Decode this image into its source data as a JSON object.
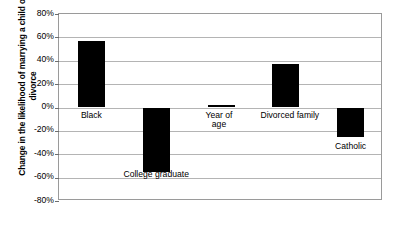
{
  "chart_data": {
    "type": "bar",
    "title": "",
    "subtitle": "",
    "xlabel": "",
    "ylabel": "Change in the likelihood of marrying a child of divorce",
    "categories": [
      "Black",
      "College graduate",
      "Year of age",
      "Divorced family",
      "Catholic"
    ],
    "values": [
      57,
      -55,
      2,
      37,
      -25
    ],
    "ylim": [
      -80,
      80
    ],
    "ytick_labels": [
      "80%",
      "60%",
      "40%",
      "20%",
      "0%",
      "-20%",
      "-40%",
      "-60%",
      "-80%"
    ],
    "ytick_values": [
      80,
      60,
      40,
      20,
      0,
      -20,
      -40,
      -60,
      -80
    ],
    "grid": true,
    "legend": "none",
    "bar_color": "#000000",
    "gridline_color": "#b4b4b4",
    "plot_border_color": "#9a9a9a",
    "background_color": "#ffffff",
    "data_labels": [
      {
        "label": "Black",
        "value": 57
      },
      {
        "label": "College graduate",
        "value": -55
      },
      {
        "label": "Year of\nage",
        "value": 2
      },
      {
        "label": "Divorced family",
        "value": 37
      },
      {
        "label": "Catholic",
        "value": -25
      }
    ]
  }
}
